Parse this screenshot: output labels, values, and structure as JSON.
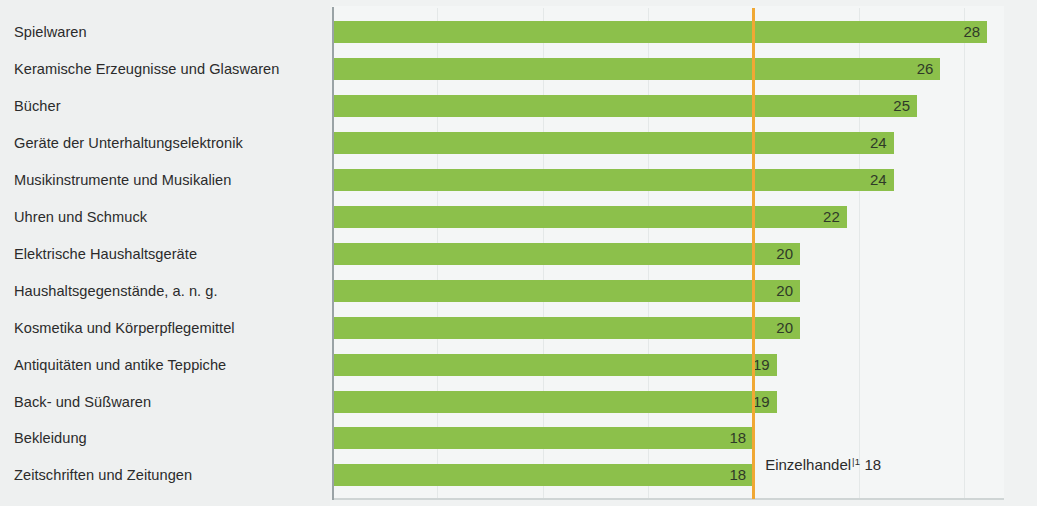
{
  "chart_data": {
    "type": "bar",
    "orientation": "horizontal",
    "title": "",
    "subtitle": "",
    "xlabel": "",
    "ylabel": "",
    "xlim": [
      0,
      30
    ],
    "grid": true,
    "legend_position": "none",
    "categories": [
      "Spielwaren",
      "Keramische Erzeugnisse und Glaswaren",
      "Bücher",
      "Geräte der Unterhaltungselektronik",
      "Musikinstrumente und Musikalien",
      "Uhren und Schmuck",
      "Elektrische Haushaltsgeräte",
      "Haushaltsgegenstände,  a. n. g.",
      "Kosmetika und Körperpflegemittel",
      "Antiquitäten und antike Teppiche",
      "Back- und Süßwaren",
      "Bekleidung",
      "Zeitschriften und Zeitungen"
    ],
    "values": [
      28,
      26,
      25,
      24,
      24,
      22,
      20,
      20,
      20,
      19,
      19,
      18,
      18
    ],
    "value_labels": [
      "28",
      "26",
      "25",
      "24",
      "24",
      "22",
      "20",
      "20",
      "20",
      "19",
      "19",
      "18",
      "18"
    ],
    "series": [
      {
        "name": "",
        "color": "#8cc04b",
        "values": [
          28,
          26,
          25,
          24,
          24,
          22,
          20,
          20,
          20,
          19,
          19,
          18,
          18
        ]
      }
    ],
    "annotations": [
      {
        "name": "reference-line",
        "label": "Einzelhandel",
        "footnote_marker": "|1",
        "value": 18,
        "value_label": "18",
        "color": "#f0a834",
        "type": "vertical-reference-line"
      }
    ],
    "gridline_values": [
      4.5,
      9,
      13.5,
      18,
      22.5,
      27
    ]
  },
  "colors": {
    "bar": "#8cc04b",
    "reference": "#f0a834",
    "axis": "#9aa3a6",
    "grid": "#e4e8e8",
    "text": "#2b2b2b",
    "value_text": "#2f3a28",
    "background": "#eef0f0",
    "plot_background": "#f4f6f6"
  }
}
